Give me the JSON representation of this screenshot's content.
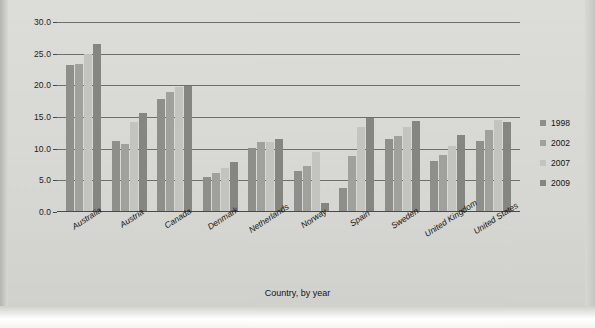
{
  "chart_data": {
    "type": "bar",
    "title": "",
    "xlabel": "Country, by year",
    "ylabel": "Foreign born (percentage)",
    "ylim": [
      0,
      30
    ],
    "yticks": [
      "0.0",
      "5.0",
      "10.0",
      "15.0",
      "20.0",
      "25.0",
      "30.0"
    ],
    "grid": true,
    "legend_position": "right",
    "categories": [
      "Australia",
      "Austria",
      "Canada",
      "Denmark",
      "Netherlands",
      "Norway",
      "Spain",
      "Sweden",
      "United Kingdom",
      "United States"
    ],
    "series": [
      {
        "name": "1998",
        "color": "#8e8e8a",
        "values": [
          23.2,
          11.2,
          17.9,
          5.5,
          10.1,
          6.5,
          3.8,
          11.5,
          8.0,
          11.2
        ]
      },
      {
        "name": "2002",
        "color": "#a0a09c",
        "values": [
          23.3,
          10.8,
          19.0,
          6.2,
          11.0,
          7.3,
          8.8,
          12.0,
          9.0,
          13.0
        ]
      },
      {
        "name": "2007",
        "color": "#c3c3bf",
        "values": [
          24.9,
          14.2,
          19.8,
          6.9,
          11.1,
          9.5,
          13.4,
          13.4,
          10.5,
          14.6
        ]
      },
      {
        "name": "2009",
        "color": "#858581",
        "values": [
          26.5,
          15.7,
          19.9,
          7.9,
          11.6,
          1.5,
          14.8,
          14.3,
          12.1,
          14.2
        ]
      }
    ]
  }
}
